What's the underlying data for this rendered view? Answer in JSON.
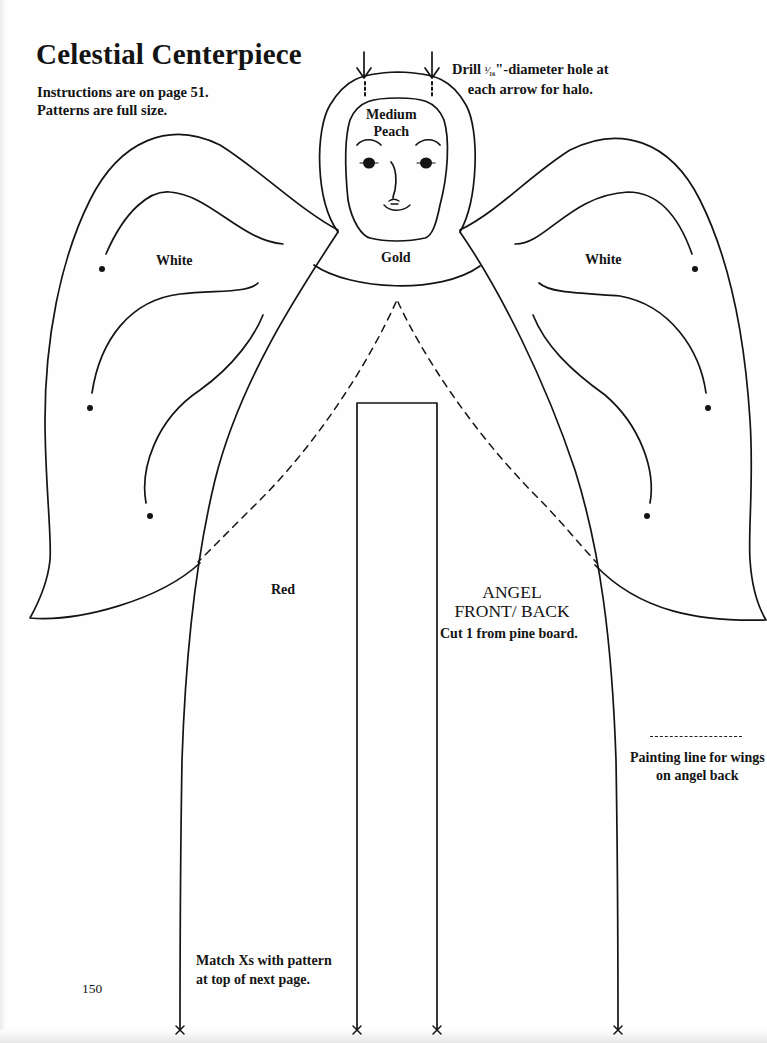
{
  "header": {
    "title": "Celestial Centerpiece",
    "instructions_line1": "Instructions are on page 51.",
    "instructions_line2": "Patterns are full size."
  },
  "drill_note": {
    "prefix": "Drill ",
    "fraction": "¹⁄₁₆",
    "suffix": "\"-diameter hole at",
    "line2": "each arrow for halo."
  },
  "color_labels": {
    "face_line1": "Medium",
    "face_line2": "Peach",
    "collar": "Gold",
    "wing_left": "White",
    "wing_right": "White",
    "robe": "Red"
  },
  "piece": {
    "name_line1": "ANGEL",
    "name_line2": "FRONT/ BACK",
    "cut_instruction": "Cut 1 from pine board."
  },
  "legend": {
    "dash_symbol": "– – – – – –",
    "line1": "Painting line for wings",
    "line2": "on angel back"
  },
  "footer": {
    "match_line1": "Match Xs with pattern",
    "match_line2": "at top of next page.",
    "page_number": "150"
  },
  "colors": {
    "ink": "#141414",
    "paper": "#fefefe"
  }
}
